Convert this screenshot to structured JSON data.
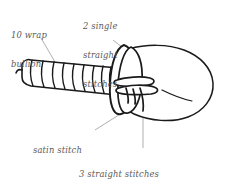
{
  "figure": {
    "line_color": "#1a1a1a",
    "label_color": "#5a5a5a",
    "background_color": "#ffffff",
    "style": "hand-drawn line art"
  },
  "annotations": {
    "bullion": {
      "line1": "10 wrap",
      "line2": "bullion",
      "text": "10 wrap bullion",
      "target": "coiled bullion knot body"
    },
    "single_straight": {
      "line1": "2 single",
      "line2": "straight",
      "line3": "stitches",
      "text": "2 single straight stitches",
      "target": "upper wings"
    },
    "satin": {
      "line1": "satin stitch",
      "text": "satin stitch",
      "target": "lower wing / collar"
    },
    "three_straight": {
      "line1": "3 straight stitches",
      "line2": "(2 short, 1 long)",
      "text": "3 straight stitches (2 short, 1 long)",
      "target": "legs / antennae"
    }
  },
  "parts": {
    "bullion_wraps": 10,
    "single_straight_stitches": 2,
    "straight_stitches_total": 3,
    "straight_stitches_short": 2,
    "straight_stitches_long": 1,
    "satin_stitch_count": 1
  }
}
